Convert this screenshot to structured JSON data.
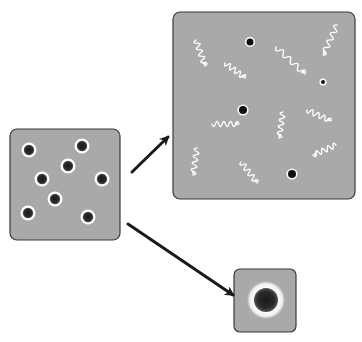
{
  "diagram": {
    "colors": {
      "background": "#ffffff",
      "box_fill": "#a9a9a9",
      "box_stroke": "#3a3a3a",
      "particle_core": "#111111",
      "particle_ring": "#ffffff",
      "wave": "#ffffff",
      "arrow": "#1a1a1a"
    },
    "boxes": {
      "source": {
        "x": 10,
        "y": 129,
        "w": 110,
        "h": 111,
        "rx": 7
      },
      "radiation": {
        "x": 173,
        "y": 12,
        "w": 182,
        "h": 187,
        "rx": 7
      },
      "merged": {
        "x": 234,
        "y": 269,
        "w": 62,
        "h": 63,
        "rx": 6
      }
    },
    "source_particles": [
      {
        "cx": 29,
        "cy": 150
      },
      {
        "cx": 82,
        "cy": 146
      },
      {
        "cx": 68,
        "cy": 166
      },
      {
        "cx": 42,
        "cy": 179
      },
      {
        "cx": 102,
        "cy": 179
      },
      {
        "cx": 55,
        "cy": 199
      },
      {
        "cx": 28,
        "cy": 213
      },
      {
        "cx": 88,
        "cy": 217
      }
    ],
    "radiation_particles": [
      {
        "cx": 250,
        "cy": 42,
        "r": 3.5
      },
      {
        "cx": 323,
        "cy": 82,
        "r": 2
      },
      {
        "cx": 243,
        "cy": 110,
        "r": 4
      },
      {
        "cx": 292,
        "cy": 174,
        "r": 4
      }
    ],
    "waves": [
      {
        "x1": 196,
        "y1": 40,
        "x2": 205,
        "y2": 66
      },
      {
        "x1": 225,
        "y1": 63,
        "x2": 245,
        "y2": 78
      },
      {
        "x1": 276,
        "y1": 47,
        "x2": 305,
        "y2": 74
      },
      {
        "x1": 337,
        "y1": 25,
        "x2": 323,
        "y2": 55
      },
      {
        "x1": 212,
        "y1": 124,
        "x2": 239,
        "y2": 124
      },
      {
        "x1": 283,
        "y1": 112,
        "x2": 279,
        "y2": 138
      },
      {
        "x1": 307,
        "y1": 110,
        "x2": 331,
        "y2": 121
      },
      {
        "x1": 336,
        "y1": 145,
        "x2": 313,
        "y2": 155
      },
      {
        "x1": 197,
        "y1": 148,
        "x2": 193,
        "y2": 175
      },
      {
        "x1": 241,
        "y1": 162,
        "x2": 257,
        "y2": 183
      }
    ],
    "merged_particle": {
      "cx": 266,
      "cy": 300,
      "ring_r": 19,
      "core_r": 12
    },
    "arrows": [
      {
        "name": "to-radiation",
        "x1": 132,
        "y1": 172,
        "x2": 168,
        "y2": 137
      },
      {
        "name": "to-merged",
        "x1": 128,
        "y1": 224,
        "x2": 233,
        "y2": 295
      }
    ]
  }
}
